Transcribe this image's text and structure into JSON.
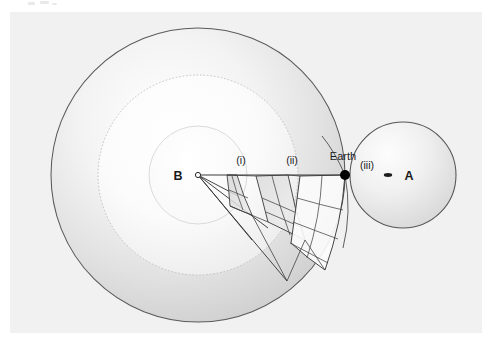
{
  "figure": {
    "background_color": "#ffffff",
    "panel_color": "#f1f1f1",
    "panel": {
      "x": 10,
      "y": 12,
      "width": 472,
      "height": 321
    },
    "stroke_color": "#4a4a4a",
    "grid_color": "#3c3c3c",
    "dot_color": "#000000"
  },
  "labels": {
    "center_point": "B",
    "shell_one": "(i)",
    "shell_two": "(ii)",
    "shell_three": "(iii)",
    "earth": "Earth",
    "sphere_a": "A"
  },
  "geometry": {
    "center_b": {
      "cx": 198,
      "cy": 175
    },
    "earth_point": {
      "cx": 345,
      "cy": 175,
      "r": 5
    },
    "sphere_a": {
      "cx": 403,
      "cy": 175,
      "r": 53
    },
    "sphere_a_marker": {
      "cx": 388,
      "cy": 175,
      "rx": 4,
      "ry": 1.8
    },
    "shells": [
      {
        "name": "inner-shell",
        "radius": 49,
        "label": "(i)",
        "label_x": 241,
        "label_y": 164
      },
      {
        "name": "middle-shell",
        "radius": 100,
        "label": "(ii)",
        "label_x": 292,
        "label_y": 164
      },
      {
        "name": "outer-shell",
        "radius": 147,
        "label": "(iii)",
        "label_x": 352,
        "label_y": 166
      }
    ],
    "sight_line": {
      "x1": 198,
      "y1": 175,
      "x2": 345,
      "y2": 175
    }
  },
  "colors": {
    "shell_outer_fill": "#dcdcdc",
    "shell_middle_fill": "#f4f4f4",
    "shell_inner_fill": "#fbfbfb",
    "sphere_a_fill": "#e3e3e3",
    "patch_fill": "#d2d2d2",
    "patch_fill_light": "#fdfdfd"
  }
}
